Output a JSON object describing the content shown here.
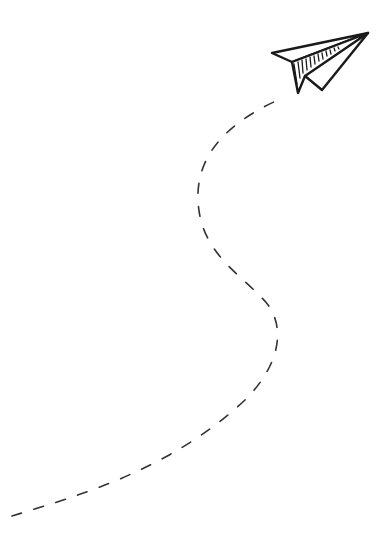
{
  "illustration": {
    "subject": "paper plane with dashed flight path",
    "background": "#ffffff",
    "stroke_color": "#1a1a1a",
    "dash_color": "#333333",
    "icons": [
      "paper-plane-icon"
    ]
  }
}
